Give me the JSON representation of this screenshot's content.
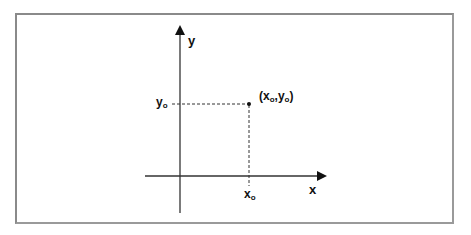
{
  "diagram": {
    "type": "cartesian-point",
    "axes": {
      "x_label": "x",
      "y_label": "y"
    },
    "point": {
      "label_open": "(x",
      "sub_x": "o",
      "comma": ",y",
      "sub_y": "o",
      "label_close": ")"
    },
    "x_tick": {
      "base": "x",
      "sub": "o"
    },
    "y_tick": {
      "base": "y",
      "sub": "o"
    },
    "colors": {
      "axis": "#333333",
      "dashed": "#333333",
      "frame": "#8a8a8a"
    }
  }
}
